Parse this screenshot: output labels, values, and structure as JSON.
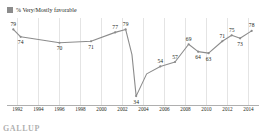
{
  "legend": {
    "swatch_color": "#8c8c8c",
    "label": "% Very/Mostly favorable"
  },
  "footer": {
    "brand": "GALLUP"
  },
  "chart_data": {
    "type": "line",
    "title": "",
    "subtitle": "",
    "xlabel": "",
    "ylabel": "",
    "grid": "vertical",
    "legend_position": "top-left",
    "line_color": "#8c8c8c",
    "marker_color": "#8c8c8c",
    "xlim": [
      1991,
      2015
    ],
    "ylim": [
      28,
      84
    ],
    "xticks": [
      "1992",
      "1994",
      "1996",
      "1998",
      "2000",
      "2002",
      "2004",
      "2006",
      "2008",
      "2010",
      "2012",
      "2014"
    ],
    "series": [
      {
        "name": "% Very/Mostly favorable",
        "points": [
          {
            "x": 1991.6,
            "y": 79,
            "label": "79",
            "label_pos": "above"
          },
          {
            "x": 1992.3,
            "y": 74,
            "label": "74",
            "label_pos": "below"
          },
          {
            "x": 1996.0,
            "y": 70,
            "label": "70",
            "label_pos": "below"
          },
          {
            "x": 1999.0,
            "y": 71,
            "label": "71",
            "label_pos": "below"
          },
          {
            "x": 2001.3,
            "y": 77,
            "label": "77",
            "label_pos": "above"
          },
          {
            "x": 2002.3,
            "y": 79,
            "label": "79",
            "label_pos": "above"
          },
          {
            "x": 2002.9,
            "y": 62,
            "label": "",
            "label_pos": "none"
          },
          {
            "x": 2003.3,
            "y": 34,
            "label": "34",
            "label_pos": "below"
          },
          {
            "x": 2004.3,
            "y": 49,
            "label": "",
            "label_pos": "none"
          },
          {
            "x": 2005.6,
            "y": 54,
            "label": "54",
            "label_pos": "above"
          },
          {
            "x": 2007.0,
            "y": 57,
            "label": "57",
            "label_pos": "above"
          },
          {
            "x": 2008.3,
            "y": 69,
            "label": "69",
            "label_pos": "above"
          },
          {
            "x": 2009.2,
            "y": 64,
            "label": "64",
            "label_pos": "below"
          },
          {
            "x": 2010.2,
            "y": 63,
            "label": "63",
            "label_pos": "below"
          },
          {
            "x": 2011.5,
            "y": 71,
            "label": "71",
            "label_pos": "above"
          },
          {
            "x": 2012.4,
            "y": 75,
            "label": "75",
            "label_pos": "above"
          },
          {
            "x": 2013.2,
            "y": 73,
            "label": "73",
            "label_pos": "below"
          },
          {
            "x": 2014.3,
            "y": 78,
            "label": "78",
            "label_pos": "above"
          }
        ]
      }
    ]
  }
}
